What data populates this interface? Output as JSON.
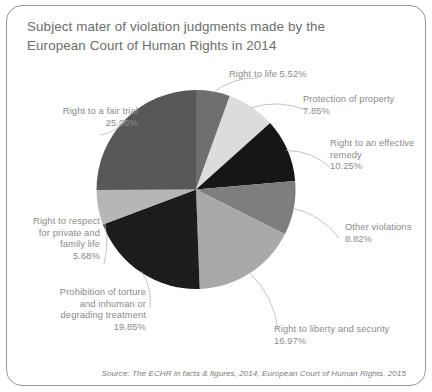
{
  "figure": {
    "title_lines": [
      "Subject mater of violation judgments made by the",
      "European Court of Human Rights in 2014"
    ],
    "source": "Source: The ECHR in facts & figures, 2014, European Court of Human Rights, 2015",
    "border_color": "#9a9a9a",
    "background": "#ffffff",
    "title_color": "#6d6d6d",
    "label_color": "#8b8b8b"
  },
  "chart_data": {
    "type": "pie",
    "title": "Subject mater of violation judgments made by the European Court of Human Rights in 2014",
    "xlabel": "",
    "ylabel": "",
    "units": "percent",
    "start_angle_deg": 0,
    "direction": "clockwise",
    "legend": "none",
    "grid": false,
    "total": 100.0,
    "categories": [
      "Right to life",
      "Protection of property",
      "Right to an effective remedy",
      "Other violations",
      "Right to liberty and security",
      "Prohibition of torture and inhuman or degrading treatment",
      "Right to respect for private and family life",
      "Right to a fair trial"
    ],
    "values": [
      5.52,
      7.85,
      10.25,
      8.82,
      16.97,
      19.85,
      5.68,
      25.06
    ],
    "colors": [
      "#6f6f6f",
      "#dcdcdc",
      "#161616",
      "#7e7e7e",
      "#a9a9a9",
      "#1c1c1c",
      "#b6b6b6",
      "#585858"
    ],
    "labels": [
      "Right to life 5.52%",
      "Protection of property\n7.85%",
      "Right to an effective\nremedy\n10.25%",
      "Other violations\n8.82%",
      "Right to liberty and security\n16.97%",
      "Prohibition of torture\nand inhuman or\ndegrading treatment\n19.85%",
      "Right to respect\nfor private and\nfamily life\n5.68%",
      "Right to a fair trial\n25.06%"
    ]
  }
}
